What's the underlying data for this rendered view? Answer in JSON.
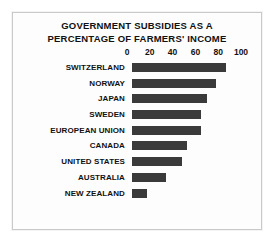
{
  "chart_data": {
    "type": "bar",
    "orientation": "horizontal",
    "title": "GOVERNMENT SUBSIDIES AS A PERCENTAGE OF FARMERS' INCOME",
    "title_lines": [
      "GOVERNMENT SUBSIDIES AS A",
      "PERCENTAGE OF FARMERS' INCOME"
    ],
    "xlabel": "",
    "ylabel": "",
    "xlim": [
      0,
      100
    ],
    "xticks": [
      0,
      20,
      40,
      60,
      80,
      100
    ],
    "xtick_labels": [
      "0",
      "20",
      "40",
      "60",
      "80",
      "100"
    ],
    "grid": false,
    "legend": false,
    "bar_color": "#3a3a3a",
    "categories": [
      "SWITZERLAND",
      "NORWAY",
      "JAPAN",
      "SWEDEN",
      "EUROPEAN UNION",
      "CANADA",
      "UNITED STATES",
      "AUSTRALIA",
      "NEW ZEALAND"
    ],
    "values": [
      84,
      75,
      67,
      62,
      62,
      49,
      45,
      30,
      13
    ]
  }
}
